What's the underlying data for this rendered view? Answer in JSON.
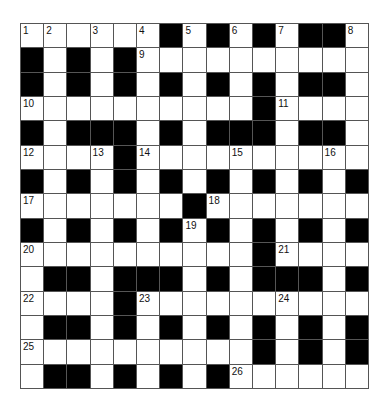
{
  "puzzle": {
    "type": "crossword",
    "rows": 15,
    "cols": 15,
    "grid": [
      [
        "1",
        "2",
        "",
        "3",
        "",
        "4",
        "#",
        "5",
        "#",
        "6",
        "#",
        "7",
        "#",
        "#",
        "8"
      ],
      [
        "#",
        "",
        "#",
        "",
        "#",
        "9",
        "",
        "",
        "",
        "",
        "",
        "",
        "",
        "",
        ""
      ],
      [
        "#",
        "",
        "#",
        "",
        "#",
        "",
        "#",
        "",
        "#",
        "",
        "#",
        "",
        "#",
        "#",
        ""
      ],
      [
        "10",
        "",
        "",
        "",
        "",
        "",
        "",
        "",
        "",
        "",
        "#",
        "11",
        "",
        "",
        ""
      ],
      [
        "#",
        "",
        "#",
        "#",
        "#",
        "",
        "#",
        "",
        "#",
        "#",
        "#",
        "",
        "#",
        "#",
        ""
      ],
      [
        "12",
        "",
        "",
        "13",
        "#",
        "14",
        "",
        "",
        "",
        "15",
        "",
        "",
        "",
        "16",
        ""
      ],
      [
        "#",
        "",
        "#",
        "",
        "#",
        "",
        "#",
        "",
        "#",
        "",
        "#",
        "",
        "#",
        "",
        "#"
      ],
      [
        "17",
        "",
        "",
        "",
        "",
        "",
        "",
        "#",
        "18",
        "",
        "",
        "",
        "",
        "",
        ""
      ],
      [
        "#",
        "",
        "#",
        "",
        "#",
        "",
        "#",
        "19",
        "#",
        "",
        "#",
        "",
        "#",
        "",
        "#"
      ],
      [
        "20",
        "",
        "",
        "",
        "",
        "",
        "",
        "",
        "",
        "",
        "#",
        "21",
        "",
        "",
        ""
      ],
      [
        "",
        "#",
        "#",
        "",
        "#",
        "#",
        "#",
        "",
        "#",
        "",
        "#",
        "#",
        "#",
        "",
        "#"
      ],
      [
        "22",
        "",
        "",
        "",
        "#",
        "23",
        "",
        "",
        "",
        "",
        "",
        "24",
        "",
        "",
        ""
      ],
      [
        "",
        "#",
        "#",
        "",
        "#",
        "",
        "#",
        "",
        "#",
        "",
        "#",
        "",
        "#",
        "",
        "#"
      ],
      [
        "25",
        "",
        "",
        "",
        "",
        "",
        "",
        "",
        "",
        "",
        "#",
        "",
        "#",
        "",
        "#"
      ],
      [
        "",
        "#",
        "#",
        "",
        "#",
        "",
        "#",
        "",
        "#",
        "26",
        "",
        "",
        "",
        "",
        ""
      ]
    ],
    "colors": {
      "block": "#000000",
      "open": "#ffffff",
      "line": "#555555"
    }
  }
}
